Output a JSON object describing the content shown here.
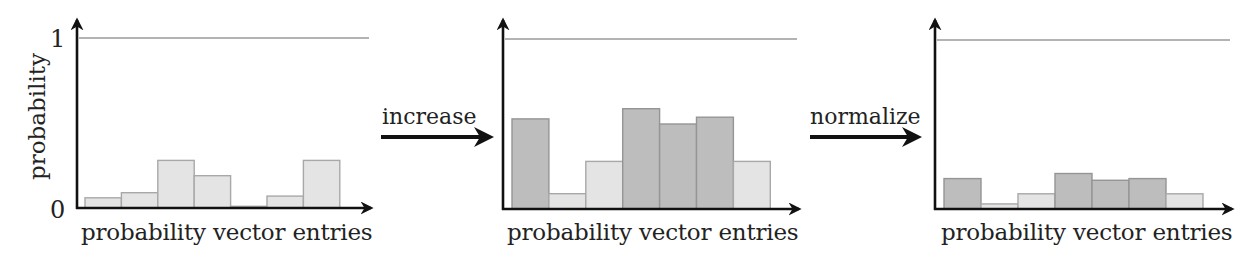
{
  "figure": {
    "ylabel": "probability",
    "ytick_top": "1",
    "ytick_bottom": "0",
    "arrows": [
      {
        "label": "increase"
      },
      {
        "label": "normalize"
      }
    ]
  },
  "colors": {
    "axis": "#111111",
    "ref_line": "#9a9a9a",
    "bar_light_fill": "#e4e4e4",
    "bar_light_stroke": "#a8a8a8",
    "bar_dark_fill": "#bdbdbd",
    "bar_dark_stroke": "#959595"
  },
  "chart_data": [
    {
      "type": "bar",
      "title": "",
      "xlabel": "probability vector entries",
      "ylabel": "probability",
      "ylim": [
        0,
        1
      ],
      "yticks": [
        "0",
        "1"
      ],
      "reference_line": 1,
      "categories": [
        "1",
        "2",
        "3",
        "4",
        "5",
        "6",
        "7"
      ],
      "values": [
        0.06,
        0.09,
        0.28,
        0.19,
        0.01,
        0.07,
        0.28
      ],
      "highlighted": [
        false,
        false,
        false,
        false,
        false,
        false,
        false
      ],
      "grid": false
    },
    {
      "type": "bar",
      "title": "",
      "xlabel": "probability vector entries",
      "ylabel": "",
      "ylim": [
        0,
        1
      ],
      "reference_line": 1,
      "categories": [
        "1",
        "2",
        "3",
        "4",
        "5",
        "6",
        "7"
      ],
      "values": [
        0.53,
        0.09,
        0.28,
        0.59,
        0.5,
        0.54,
        0.28
      ],
      "highlighted": [
        true,
        false,
        false,
        true,
        true,
        true,
        false
      ],
      "annotation": "increase",
      "grid": false
    },
    {
      "type": "bar",
      "title": "",
      "xlabel": "probability vector entries",
      "ylabel": "",
      "ylim": [
        0,
        1
      ],
      "reference_line": 1,
      "categories": [
        "1",
        "2",
        "3",
        "4",
        "5",
        "6",
        "7"
      ],
      "values": [
        0.18,
        0.03,
        0.09,
        0.21,
        0.17,
        0.18,
        0.09
      ],
      "highlighted": [
        true,
        false,
        false,
        true,
        true,
        true,
        false
      ],
      "annotation": "normalize",
      "grid": false
    }
  ]
}
